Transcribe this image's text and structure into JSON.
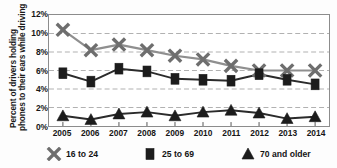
{
  "chart_data": {
    "type": "line",
    "title": "",
    "xlabel": "",
    "ylabel": "Percent of drivers holding phones to their ears while driving",
    "ylabel_lines": [
      "Percent of drivers holding",
      "phones to their ears while driving"
    ],
    "categories": [
      "2005",
      "2006",
      "2007",
      "2008",
      "2009",
      "2010",
      "2011",
      "2012",
      "2013",
      "2014"
    ],
    "x": [
      2005,
      2006,
      2007,
      2008,
      2009,
      2010,
      2011,
      2012,
      2013,
      2014
    ],
    "ylim": [
      0,
      12
    ],
    "ytick_values": [
      0,
      2,
      4,
      6,
      8,
      10,
      12
    ],
    "ytick_labels": [
      "0%",
      "2%",
      "4%",
      "6%",
      "8%",
      "10%",
      "12%"
    ],
    "grid": true,
    "grid_style": "dashed-horizontal",
    "legend_position": "below-plot",
    "series": [
      {
        "name": "16 to 24",
        "marker": "x-cross",
        "color": "#8f8f8f",
        "marker_color": "#6e6e6e",
        "values": [
          10.4,
          8.2,
          8.8,
          8.2,
          7.6,
          7.2,
          6.5,
          6.0,
          6.0,
          6.0
        ]
      },
      {
        "name": "25 to 69",
        "marker": "square",
        "color": "#2b2b2b",
        "marker_color": "#1c1c1c",
        "values": [
          5.7,
          4.8,
          6.2,
          5.9,
          5.1,
          5.0,
          4.9,
          5.6,
          5.0,
          4.5
        ]
      },
      {
        "name": "70 and older",
        "marker": "triangle",
        "color": "#2b2b2b",
        "marker_color": "#1c1c1c",
        "values": [
          1.1,
          0.7,
          1.3,
          1.5,
          1.1,
          1.5,
          1.7,
          1.4,
          0.8,
          1.0
        ]
      }
    ]
  },
  "legend": {
    "entries": [
      {
        "label": "16 to 24",
        "marker": "x-cross"
      },
      {
        "label": "25 to 69",
        "marker": "square"
      },
      {
        "label": "70 and older",
        "marker": "triangle"
      }
    ]
  },
  "colors": {
    "axis": "#8c8c8c",
    "grid": "#b0b0b0",
    "text": "#161616",
    "series_light": "#8f8f8f",
    "series_dark": "#2b2b2b",
    "background": "#ffffff"
  }
}
